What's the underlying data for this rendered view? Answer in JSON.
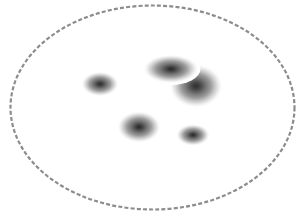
{
  "diagram": {
    "boundary": {
      "shape": "ellipse",
      "cx": 152.5,
      "cy": 107.5,
      "rx": 142,
      "ry": 102,
      "stroke": "#8c8c8c",
      "dash": "4 2.2",
      "stroke_width": 2.2
    },
    "blobs": [
      {
        "id": "blob-left",
        "cx": 100,
        "cy": 84,
        "rx": 19,
        "ry": 12.5,
        "core": "#2a2a2a",
        "outline": ""
      },
      {
        "id": "blob-right-large",
        "cx": 196,
        "cy": 86,
        "rx": 27,
        "ry": 22,
        "core": "#2e2e2e",
        "outline": ""
      },
      {
        "id": "blob-top-center",
        "cx": 171,
        "cy": 69,
        "rx": 28,
        "ry": 14.5,
        "core": "#262626",
        "outline": "#ffffff"
      },
      {
        "id": "blob-bottom-left",
        "cx": 139,
        "cy": 127,
        "rx": 22,
        "ry": 16,
        "core": "#262626",
        "outline": ""
      },
      {
        "id": "blob-bottom-right",
        "cx": 193,
        "cy": 135,
        "rx": 17,
        "ry": 11,
        "core": "#262626",
        "outline": ""
      }
    ],
    "colors": {
      "background": "#ffffff",
      "blob_mid": "#8a8a8a",
      "blob_edge": "#e6e6e6"
    }
  }
}
